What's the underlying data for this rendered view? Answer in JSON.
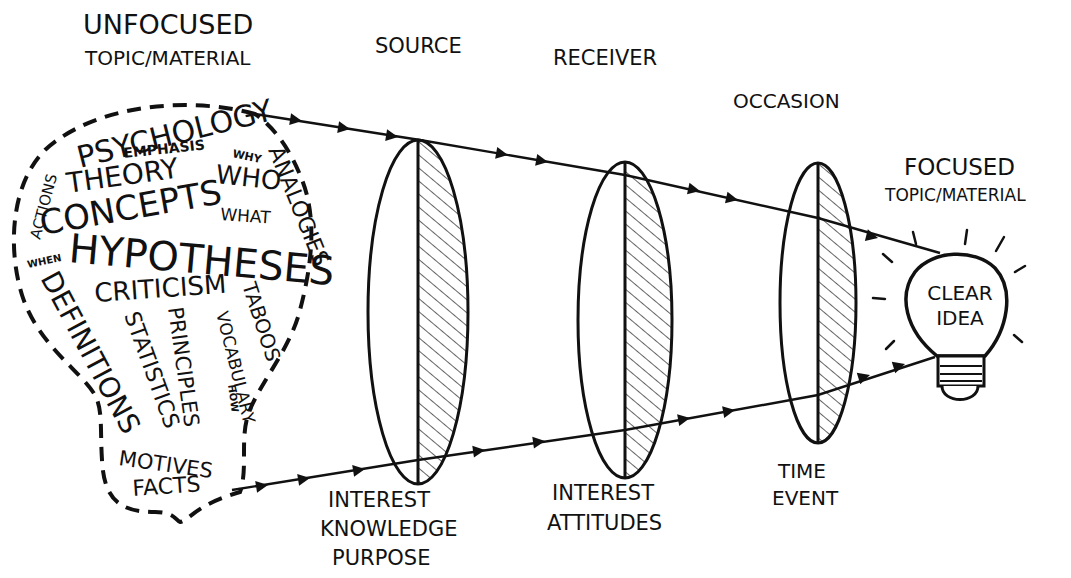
{
  "diagram": {
    "title_left": {
      "line1": "UNFOCUSED",
      "line2": "TOPIC/MATERIAL"
    },
    "title_right": {
      "line1": "FOCUSED",
      "line2": "TOPIC/MATERIAL"
    },
    "stages": [
      {
        "name": "SOURCE",
        "factors": [
          "INTEREST",
          "KNOWLEDGE",
          "PURPOSE"
        ]
      },
      {
        "name": "RECEIVER",
        "factors": [
          "INTEREST",
          "ATTITUDES"
        ]
      },
      {
        "name": "OCCASION",
        "factors": [
          "TIME",
          "EVENT"
        ]
      }
    ],
    "bulb_words": {
      "psychology": "PSYCHOLOGY",
      "emphasis": "EMPHASIS",
      "why": "WHY",
      "actions": "ACTIONS",
      "theory": "THEORY",
      "who": "WHO",
      "analogies": "ANALOGIES",
      "concepts": "CONCEPTS",
      "what": "WHAT",
      "when": "WHEN",
      "hypotheses": "HYPOTHESES",
      "definitions": "DEFINITIONS",
      "criticism": "CRITICISM",
      "taboos": "TABOOS",
      "statistics": "STATISTICS",
      "principles": "PRINCIPLES",
      "vocabulary": "VOCABULARY",
      "how": "HOW",
      "motives": "MOTIVES",
      "facts": "FACTS"
    },
    "result": {
      "line1": "CLEAR",
      "line2": "IDEA"
    },
    "colors": {
      "ink": "#111111",
      "background": "#ffffff"
    }
  }
}
